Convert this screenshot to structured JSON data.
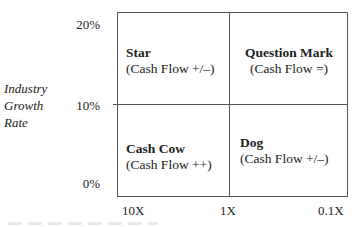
{
  "diagram": {
    "y_axis": {
      "title_lines": [
        "Industry",
        "Growth",
        "Rate"
      ],
      "ticks": [
        "20%",
        "10%",
        "0%"
      ]
    },
    "x_axis": {
      "ticks": [
        "10X",
        "1X",
        "0.1X"
      ]
    },
    "quadrants": [
      {
        "id": "star",
        "name": "Star",
        "cash_flow": "(Cash Flow +/–)",
        "position": "top-left"
      },
      {
        "id": "question-mark",
        "name": "Question Mark",
        "cash_flow": "(Cash Flow =)",
        "position": "top-right"
      },
      {
        "id": "cash-cow",
        "name": "Cash Cow",
        "cash_flow": "(Cash Flow ++)",
        "position": "bottom-left"
      },
      {
        "id": "dog",
        "name": "Dog",
        "cash_flow": "(Cash Flow +/–)",
        "position": "bottom-right"
      }
    ]
  }
}
